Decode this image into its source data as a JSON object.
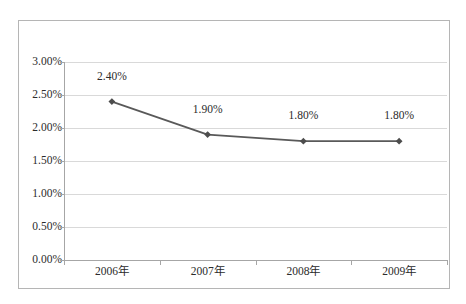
{
  "chart_data": {
    "type": "line",
    "title": "",
    "subtitle": "",
    "xlabel": "",
    "ylabel": "",
    "categories": [
      "2006年",
      "2007年",
      "2008年",
      "2009年"
    ],
    "values": [
      2.4,
      1.9,
      1.8,
      1.8
    ],
    "point_labels": [
      "2.40%",
      "1.90%",
      "1.80%",
      "1.80%"
    ],
    "ylim": [
      0,
      3.0
    ],
    "y_tick_values": [
      3.0,
      2.5,
      2.0,
      1.5,
      1.0,
      0.5,
      0.0
    ],
    "y_tick_labels": [
      "3.00%",
      "2.50%",
      "2.00%",
      "1.50%",
      "1.00%",
      "0.50%",
      "0.00%"
    ],
    "grid": true,
    "legend": false,
    "legend_position": "none",
    "series": [
      {
        "name": "",
        "values": [
          2.4,
          1.9,
          1.8,
          1.8
        ]
      }
    ],
    "colors": {
      "line": "#595959",
      "marker": "#4d4d4d",
      "gridline": "#d9d9d9",
      "axis": "#a6a6a6",
      "frame_border": "#b5b5b5",
      "text": "#2b2b2b",
      "plot_background": "#ffffff"
    },
    "marker_shape": "diamond"
  }
}
